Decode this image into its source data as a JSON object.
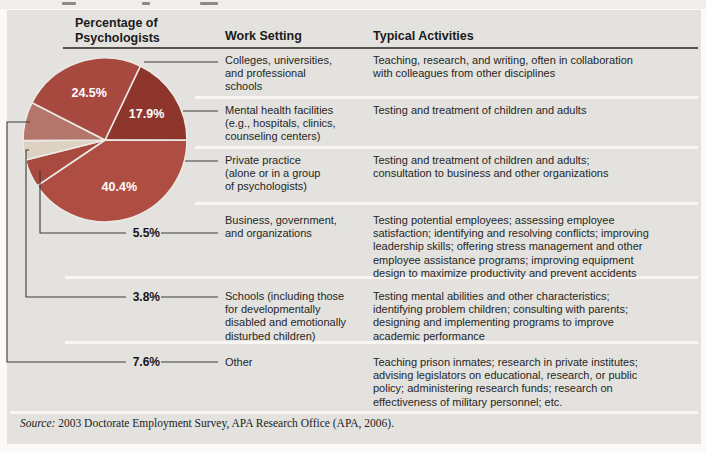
{
  "figure": {
    "headers": {
      "col1": "Percentage of\nPsychologists",
      "col2": "Work Setting",
      "col3": "Typical Activities"
    },
    "source": {
      "label": "Source:",
      "text": " 2003 Doctorate Employment Survey, APA Research Office (APA, 2006)."
    }
  },
  "chart_data": {
    "type": "pie",
    "categories": [
      "Colleges, universities, and professional schools",
      "Mental health facilities",
      "Private practice",
      "Business, government, and organizations",
      "Schools",
      "Other"
    ],
    "values": [
      24.5,
      17.9,
      40.4,
      5.5,
      3.8,
      7.6
    ],
    "labels": [
      "24.5%",
      "17.9%",
      "40.4%",
      "5.5%",
      "3.8%",
      "7.6%"
    ],
    "colors": [
      "#a8493f",
      "#8e362c",
      "#ae4d42",
      "#a84a40",
      "#ddd1c2",
      "#b4756a"
    ],
    "inside_label": [
      true,
      true,
      true,
      false,
      false,
      false
    ],
    "legend_position": "none",
    "layout": {
      "center": [
        105,
        140
      ],
      "radius": 82,
      "start_angle_deg": -64.5,
      "draw_order": [
        1,
        2,
        3,
        4,
        5,
        0
      ],
      "label_radius_factor": 0.6
    }
  },
  "table": {
    "rows": [
      {
        "percent": "24.5%",
        "setting": "Colleges, universities,\nand professional\nschools",
        "activities": "Teaching, research, and writing, often in collaboration\nwith colleagues from other disciplines"
      },
      {
        "percent": "17.9%",
        "setting": "Mental health facilities\n(e.g., hospitals, clinics,\ncounseling centers)",
        "activities": "Testing and treatment of children and adults"
      },
      {
        "percent": "40.4%",
        "setting": "Private practice\n(alone or in a group\nof psychologists)",
        "activities": "Testing and treatment of children and adults;\nconsultation to business and other organizations"
      },
      {
        "percent": "5.5%",
        "setting": "Business, government,\nand organizations",
        "activities": "Testing potential employees; assessing employee\nsatisfaction; identifying and resolving conflicts; improving\nleadership skills; offering stress management and other\nemployee assistance programs; improving equipment\ndesign to maximize productivity and prevent accidents"
      },
      {
        "percent": "3.8%",
        "setting": "Schools (including those\nfor developmentally\ndisabled and emotionally\ndisturbed children)",
        "activities": "Testing mental abilities and other characteristics;\nidentifying problem children; consulting with parents;\ndesigning and implementing programs to improve\nacademic performance"
      },
      {
        "percent": "7.6%",
        "setting": "Other",
        "activities": "Teaching prison inmates; research in private institutes;\nadvising legislators on educational, research, or public\npolicy; administering research funds; research on\neffectiveness of military personnel; etc."
      }
    ]
  }
}
